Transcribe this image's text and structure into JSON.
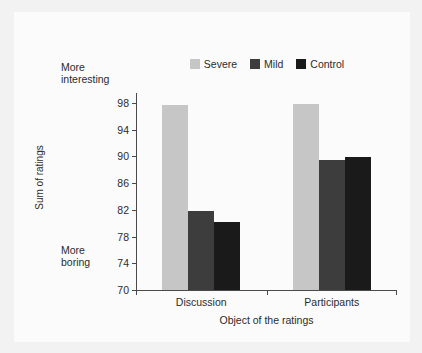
{
  "chart_data": {
    "type": "bar",
    "title": "",
    "xlabel": "Object of the ratings",
    "ylabel": "Sum of ratings",
    "categories": [
      "Discussion",
      "Participants"
    ],
    "series": [
      {
        "name": "Severe",
        "color": "#c6c6c6",
        "values": [
          97.7,
          97.8
        ]
      },
      {
        "name": "Mild",
        "color": "#3d3d3d",
        "values": [
          81.9,
          89.4
        ]
      },
      {
        "name": "Control",
        "color": "#1a1a1a",
        "values": [
          80.2,
          89.9
        ]
      }
    ],
    "ylim": [
      70,
      99.5
    ],
    "yticks": [
      70,
      74,
      78,
      82,
      86,
      90,
      94,
      98
    ],
    "grid": false,
    "legend_position": "top-center",
    "annotations": [
      {
        "name": "axis-high-note",
        "text": "More\ninteresting",
        "position": "top-left"
      },
      {
        "name": "axis-low-note",
        "text": "More\nboring",
        "position": "bottom-left"
      }
    ]
  },
  "colors": {
    "figure_background": "#f2f2f2",
    "plot_background": "#fbfbfb",
    "axis": "#4a4a4a",
    "text": "#2b2b2b"
  }
}
